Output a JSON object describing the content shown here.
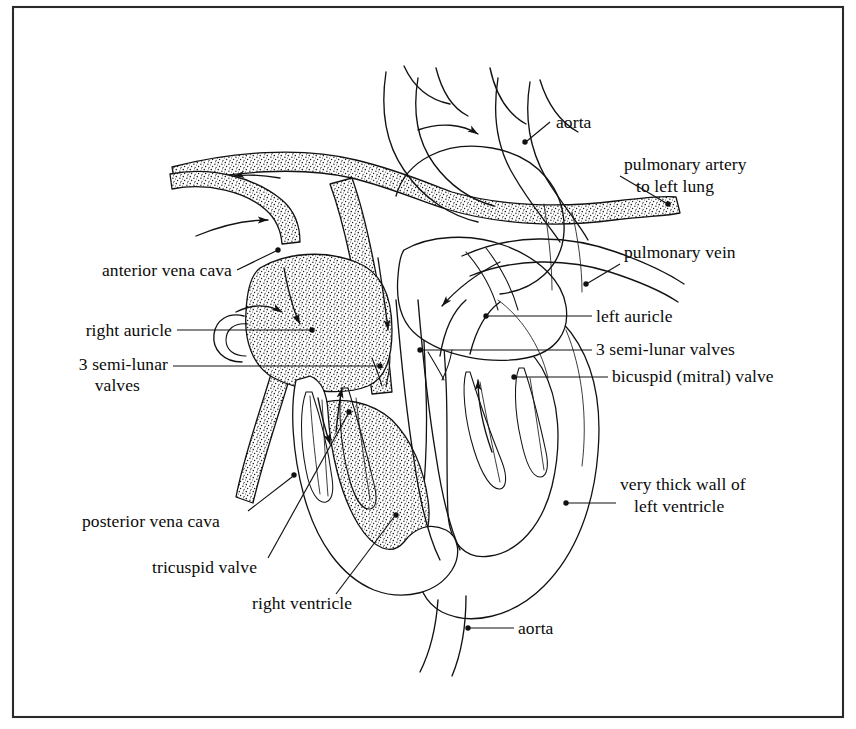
{
  "figure": {
    "background_color": "#ffffff",
    "ink_color": "#121212",
    "frame": {
      "color": "#2a2a2a",
      "x": 13,
      "y": 7,
      "width": 830,
      "height": 710
    }
  },
  "labels": [
    {
      "id": "aorta-top",
      "text": "aorta",
      "text_x": 556,
      "text_y": 128,
      "anchor": "start",
      "lines": [],
      "leader": "M 550 122 L 527 141",
      "dot": {
        "x": 525,
        "y": 142
      }
    },
    {
      "id": "pulmonary-artery",
      "text_line1": "pulmonary artery",
      "text_line2": "to left lung",
      "text_x": 624,
      "text_y": 170,
      "line2_x": 636,
      "line2_y": 192,
      "anchor": "start",
      "leader": "M 620 176 L 666 203",
      "dot": {
        "x": 668,
        "y": 204
      }
    },
    {
      "id": "pulmonary-vein",
      "text": "pulmonary vein",
      "text_x": 624,
      "text_y": 258,
      "anchor": "start",
      "leader": "M 620 264 L 588 283",
      "dot": {
        "x": 586,
        "y": 284
      }
    },
    {
      "id": "left-auricle",
      "text": "left auricle",
      "text_x": 596,
      "text_y": 322,
      "anchor": "start",
      "leader": "M 592 316 L 487 316",
      "dot": {
        "x": 486,
        "y": 316
      }
    },
    {
      "id": "semi-lunar-valves-right",
      "text": "3 semi-lunar valves",
      "text_x": 596,
      "text_y": 355,
      "anchor": "start",
      "leader": "M 592 350 L 422 350",
      "dot": {
        "x": 420,
        "y": 350
      }
    },
    {
      "id": "bicuspid-mitral-valve",
      "text": "bicuspid (mitral) valve",
      "text_x": 612,
      "text_y": 382,
      "anchor": "start",
      "leader": "M 608 377 L 516 377",
      "dot": {
        "x": 514,
        "y": 377
      }
    },
    {
      "id": "very-thick-wall-left-ventricle",
      "text_line1": "very thick wall of",
      "text_line2": "left ventricle",
      "text_x": 620,
      "text_y": 490,
      "line2_x": 634,
      "line2_y": 512,
      "anchor": "start",
      "leader": "M 616 503 L 568 503",
      "dot": {
        "x": 566,
        "y": 503
      }
    },
    {
      "id": "aorta-bottom",
      "text": "aorta",
      "text_x": 518,
      "text_y": 634,
      "anchor": "start",
      "leader": "M 514 628 L 470 628",
      "dot": {
        "x": 468,
        "y": 628
      }
    },
    {
      "id": "anterior-vena-cava",
      "text": "anterior vena cava",
      "text_x": 232,
      "text_y": 276,
      "anchor": "end",
      "leader": "M 237 270 L 276 251",
      "dot": {
        "x": 278,
        "y": 250
      }
    },
    {
      "id": "right-auricle",
      "text": "right auricle",
      "text_x": 172,
      "text_y": 336,
      "anchor": "end",
      "leader": "M 177 330 L 310 330",
      "dot": {
        "x": 312,
        "y": 330
      }
    },
    {
      "id": "semi-lunar-valves-left",
      "text_line1": "3 semi-lunar",
      "text_line2": "valves",
      "text_x": 168,
      "text_y": 370,
      "line2_x": 140,
      "line2_y": 391,
      "anchor": "end",
      "leader": "M 173 366 L 378 366",
      "dot": {
        "x": 380,
        "y": 366
      }
    },
    {
      "id": "posterior-vena-cava",
      "text": "posterior vena cava",
      "text_x": 82,
      "text_y": 527,
      "anchor": "start",
      "leader": "M 248 511 L 292 477",
      "dot": {
        "x": 294,
        "y": 475
      }
    },
    {
      "id": "tricuspid-valve",
      "text": "tricuspid valve",
      "text_x": 152,
      "text_y": 573,
      "anchor": "start",
      "leader": "M 268 558 L 348 414",
      "dot": {
        "x": 349,
        "y": 412
      }
    },
    {
      "id": "right-ventricle",
      "text": "right ventricle",
      "text_x": 252,
      "text_y": 609,
      "anchor": "start",
      "leader": "M 336 594 L 394 517",
      "dot": {
        "x": 396,
        "y": 515
      }
    }
  ],
  "flow_arrows": [
    {
      "id": "arrow-aortic-arch",
      "note": "blood leaving through aortic arch"
    },
    {
      "id": "arrow-pulmonary-artery-left",
      "note": "deoxygenated blood to lungs"
    },
    {
      "id": "arrow-anterior-vena-cava-in",
      "note": "blood entering right auricle"
    },
    {
      "id": "arrow-pulmonary-vein-in",
      "note": "oxygenated blood entering left auricle"
    },
    {
      "id": "arrow-right-auricle-to-ventricle",
      "note": "through tricuspid valve"
    },
    {
      "id": "arrow-left-ventricle-out",
      "note": "out to aorta"
    }
  ],
  "shaded_regions": [
    {
      "id": "right-auricle-cavity",
      "fill": "stipple"
    },
    {
      "id": "right-ventricle-cavity",
      "fill": "stipple"
    },
    {
      "id": "pulmonary-artery-vessel",
      "fill": "stipple"
    },
    {
      "id": "anterior-vena-cava-vessel",
      "fill": "stipple"
    },
    {
      "id": "posterior-vena-cava-vessel",
      "fill": "stipple"
    }
  ]
}
